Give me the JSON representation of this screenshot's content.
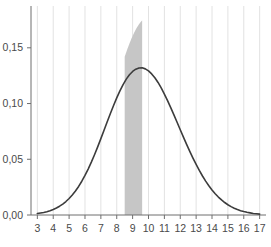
{
  "chart_data": {
    "type": "line",
    "title": "",
    "xlabel": "",
    "ylabel": "",
    "xlim": [
      2.6,
      17.4
    ],
    "ylim": [
      0.0,
      0.1875
    ],
    "grid": true,
    "grid_axis": "x",
    "legend": "none",
    "distribution": {
      "kind": "normal",
      "mean": 10.0,
      "sigma": 2.25,
      "peak_value": 0.177
    },
    "xticks": [
      3,
      4,
      5,
      6,
      7,
      8,
      9,
      10,
      11,
      12,
      13,
      14,
      15,
      16,
      17
    ],
    "xticklabels": [
      "3",
      "4",
      "5",
      "6",
      "7",
      "8",
      "9",
      "10",
      "11",
      "12",
      "13",
      "14",
      "15",
      "16",
      "17"
    ],
    "yticks": [
      0.0,
      0.05,
      0.1,
      0.15
    ],
    "yticklabels": [
      "0,00",
      "0,05",
      "0,10",
      "0,15"
    ],
    "shaded_region": {
      "x_start": 8.5,
      "x_end": 9.6,
      "color": "#c6c6c6",
      "label": ""
    },
    "series": [
      {
        "name": "normal-density",
        "color": "#3c3c3c",
        "x": [
          3.0,
          3.2,
          3.4,
          3.6,
          3.8,
          4.0,
          4.2,
          4.4,
          4.6,
          4.8,
          5.0,
          5.2,
          5.4,
          5.6,
          5.8,
          6.0,
          6.2,
          6.4,
          6.6,
          6.8,
          7.0,
          7.2,
          7.4,
          7.6,
          7.8,
          8.0,
          8.2,
          8.4,
          8.6,
          8.8,
          9.0,
          9.2,
          9.4,
          9.6,
          9.8,
          10.0,
          10.2,
          10.4,
          10.6,
          10.8,
          11.0,
          11.2,
          11.4,
          11.6,
          11.8,
          12.0,
          12.2,
          12.4,
          12.6,
          12.8,
          13.0,
          13.2,
          13.4,
          13.6,
          13.8,
          14.0,
          14.2,
          14.4,
          14.6,
          14.8,
          15.0,
          15.2,
          15.4,
          15.6,
          15.8,
          16.0,
          16.2,
          16.4,
          16.6,
          16.8,
          17.0
        ],
        "y": [
          0.0013,
          0.0018,
          0.0023,
          0.003,
          0.0039,
          0.005,
          0.0063,
          0.0079,
          0.0098,
          0.0121,
          0.0148,
          0.0179,
          0.0215,
          0.0256,
          0.0303,
          0.0355,
          0.0412,
          0.0474,
          0.0541,
          0.0611,
          0.0685,
          0.076,
          0.0836,
          0.0911,
          0.0983,
          0.1051,
          0.1114,
          0.117,
          0.1219,
          0.1258,
          0.1288,
          0.1308,
          0.1319,
          0.132,
          0.1311,
          0.1293,
          0.1266,
          0.1231,
          0.1189,
          0.114,
          0.1085,
          0.1026,
          0.0963,
          0.0898,
          0.0832,
          0.0765,
          0.0699,
          0.0634,
          0.0571,
          0.0511,
          0.0454,
          0.04,
          0.035,
          0.0304,
          0.0263,
          0.0225,
          0.0191,
          0.0161,
          0.0135,
          0.0112,
          0.0092,
          0.0075,
          0.0061,
          0.0049,
          0.0039,
          0.0031,
          0.0024,
          0.0019,
          0.0014,
          0.0011,
          0.0008
        ]
      }
    ]
  },
  "axes": {
    "axis_color": "#6e6e6e",
    "gridline_color": "#e2e2e2",
    "tick_label_color": "#4a4a4a",
    "background": "#ffffff"
  }
}
